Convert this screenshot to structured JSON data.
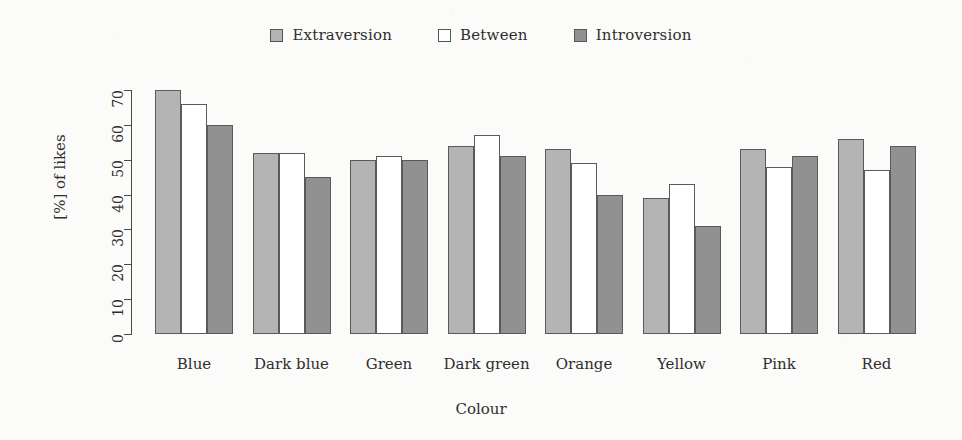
{
  "chart_data": {
    "type": "bar",
    "title": "",
    "xlabel": "Colour",
    "ylabel": "[%] of likes",
    "categories": [
      "Blue",
      "Dark blue",
      "Green",
      "Dark green",
      "Orange",
      "Yellow",
      "Pink",
      "Red"
    ],
    "series": [
      {
        "name": "Extraversion",
        "color": "#b4b4b4",
        "values": [
          70,
          52,
          50,
          54,
          53,
          39,
          53,
          56
        ]
      },
      {
        "name": "Between",
        "color": "#ffffff",
        "values": [
          66,
          52,
          51,
          57,
          49,
          43,
          48,
          47
        ]
      },
      {
        "name": "Introversion",
        "color": "#919191",
        "values": [
          60,
          45,
          50,
          51,
          40,
          31,
          51,
          54
        ]
      }
    ],
    "ylim": [
      0,
      70
    ],
    "yticks": [
      0,
      10,
      20,
      30,
      40,
      50,
      60,
      70
    ],
    "ytick_labels": [
      "0",
      "10",
      "20",
      "30",
      "40",
      "50",
      "60",
      "70"
    ],
    "grid": false,
    "legend_position": "top-center",
    "legend_entries": [
      "Extraversion",
      "Between",
      "Introversion"
    ],
    "bar_border_color": "#5a5a5a",
    "axis_color": "#4a4a4a",
    "background_color": "#fbfbfa"
  }
}
